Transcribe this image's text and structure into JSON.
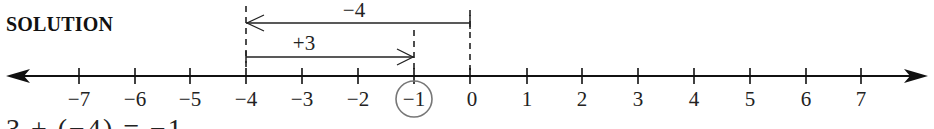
{
  "heading": "SOLUTION",
  "number_line": {
    "min": -7,
    "max": 7,
    "ticks": [
      "−7",
      "−6",
      "−5",
      "−4",
      "−3",
      "−2",
      "−1",
      "0",
      "1",
      "2",
      "3",
      "4",
      "5",
      "6",
      "7"
    ],
    "circled_value": "−1",
    "arrows": [
      {
        "label": "−4",
        "from": 0,
        "to": -4,
        "direction": "left"
      },
      {
        "label": "+3",
        "from": -4,
        "to": -1,
        "direction": "right"
      }
    ]
  },
  "cut_off_text": "3 + (−4) = −1"
}
